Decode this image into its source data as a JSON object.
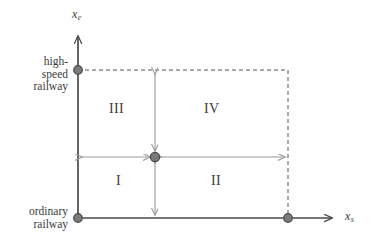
{
  "figure": {
    "type": "quadrant-diagram",
    "background_color": "#ffffff",
    "axis_color": "#4a4a4a",
    "arrow_color": "#9a9a9a",
    "node_color": "#6e6e6e",
    "dashed_color": "#555555",
    "text_color": "#3b3b3b"
  },
  "axes": {
    "y": {
      "label_text": "x",
      "label_sub": "e",
      "name": "x_e"
    },
    "x": {
      "label_text": "x",
      "label_sub": "s",
      "name": "x_s"
    }
  },
  "tick_labels": {
    "y_top": {
      "line1": "high-",
      "line2": "speed",
      "line3": "railway",
      "full": "high-speed railway"
    },
    "y_bottom": {
      "line1": "ordinary",
      "line2": "railway",
      "full": "ordinary railway"
    }
  },
  "quadrants": [
    {
      "id": "q3",
      "label": "III",
      "position": "top-left"
    },
    {
      "id": "q4",
      "label": "IV",
      "position": "top-right"
    },
    {
      "id": "q1",
      "label": "I",
      "position": "bottom-left"
    },
    {
      "id": "q2",
      "label": "II",
      "position": "bottom-right"
    }
  ],
  "nodes": [
    {
      "id": "origin",
      "x": 78,
      "y": 218
    },
    {
      "id": "high-speed-axis-point",
      "x": 78,
      "y": 70
    },
    {
      "id": "x-axis-point",
      "x": 288,
      "y": 218
    },
    {
      "id": "center",
      "x": 155,
      "y": 157
    }
  ],
  "arrows": [
    {
      "id": "arrow-left",
      "direction": "horizontal",
      "from_x": 78,
      "to_x": 155,
      "y": 157,
      "double_headed": true
    },
    {
      "id": "arrow-right",
      "direction": "horizontal",
      "from_x": 155,
      "to_x": 288,
      "y": 157,
      "double_headed": true
    },
    {
      "id": "arrow-up",
      "direction": "vertical",
      "x": 155,
      "from_y": 70,
      "to_y": 157,
      "double_headed": true
    },
    {
      "id": "arrow-down",
      "direction": "vertical",
      "x": 155,
      "from_y": 157,
      "to_y": 218,
      "double_headed": true
    }
  ],
  "dashed_boundary": {
    "top_y": 70,
    "right_x": 288,
    "left_x": 78,
    "bottom_y": 218
  }
}
